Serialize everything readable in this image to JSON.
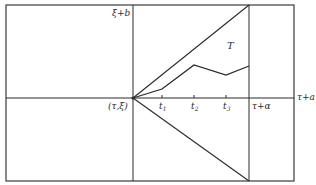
{
  "diagram": {
    "colors": {
      "background": "#ffffff",
      "line": "#2a2a2a",
      "frame": "#3a3a3a"
    },
    "labels": {
      "top_left_of_vertical": "ξ+b",
      "origin": "(τ,ξ)",
      "t1": "t",
      "t1_sub": "1",
      "t2": "t",
      "t2_sub": "2",
      "t3": "t",
      "t3_sub": "3",
      "right_vertical": "τ+α",
      "axis_end": "τ+a",
      "region": "T"
    },
    "geometry": {
      "frame": {
        "x1": 6,
        "y1": 5,
        "x2": 294,
        "y2": 181
      },
      "origin": {
        "x": 133,
        "y": 98
      },
      "right_vertical_x": 249,
      "upper_line_end": {
        "x": 249,
        "y": 5
      },
      "lower_line_end": {
        "x": 249,
        "y": 181
      },
      "polyline": [
        {
          "x": 133,
          "y": 98
        },
        {
          "x": 162,
          "y": 89
        },
        {
          "x": 194,
          "y": 65
        },
        {
          "x": 226,
          "y": 75
        },
        {
          "x": 249,
          "y": 66
        }
      ],
      "ticks_x": [
        162,
        194,
        226
      ]
    }
  }
}
